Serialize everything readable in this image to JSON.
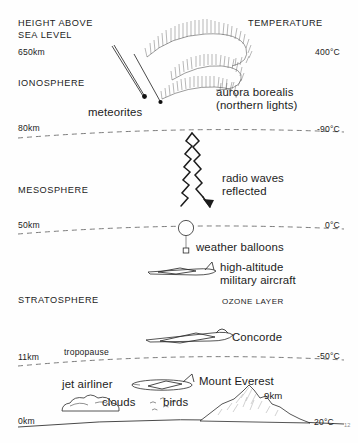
{
  "diagram": {
    "title_left_line1": "HEIGHT ABOVE",
    "title_left_line2": "SEA LEVEL",
    "title_right": "TEMPERATURE",
    "page_number": "12"
  },
  "scale": {
    "top_altitude": "650km",
    "top_temperature": "400°C"
  },
  "layers": [
    {
      "name": "IONOSPHERE"
    },
    {
      "name": "MESOSPHERE"
    },
    {
      "name": "STRATOSPHERE"
    }
  ],
  "boundaries": [
    {
      "altitude": "80km",
      "temperature": "-90°C",
      "name": ""
    },
    {
      "altitude": "50km",
      "temperature": "0°C",
      "name": ""
    },
    {
      "altitude": "11km",
      "temperature": "-50°C",
      "name": "tropopause"
    },
    {
      "altitude": "0km",
      "temperature": "20°C",
      "name": ""
    }
  ],
  "features": {
    "ozone_layer": "OZONE LAYER",
    "meteorites": "meteorites",
    "aurora_line1": "aurora borealis",
    "aurora_line2": "(northern lights)",
    "radio_line1": "radio waves",
    "radio_line2": "reflected",
    "weather_balloons": "weather balloons",
    "military_line1": "high-altitude",
    "military_line2": "military aircraft",
    "concorde": "Concorde",
    "jet_airliner": "jet airliner",
    "clouds": "clouds",
    "birds": "birds",
    "mount_everest": "Mount Everest",
    "everest_height": "9km"
  },
  "colors": {
    "ink": "#1c1c1c",
    "boundary": "#6e6e6e",
    "background": "#fefefe"
  }
}
